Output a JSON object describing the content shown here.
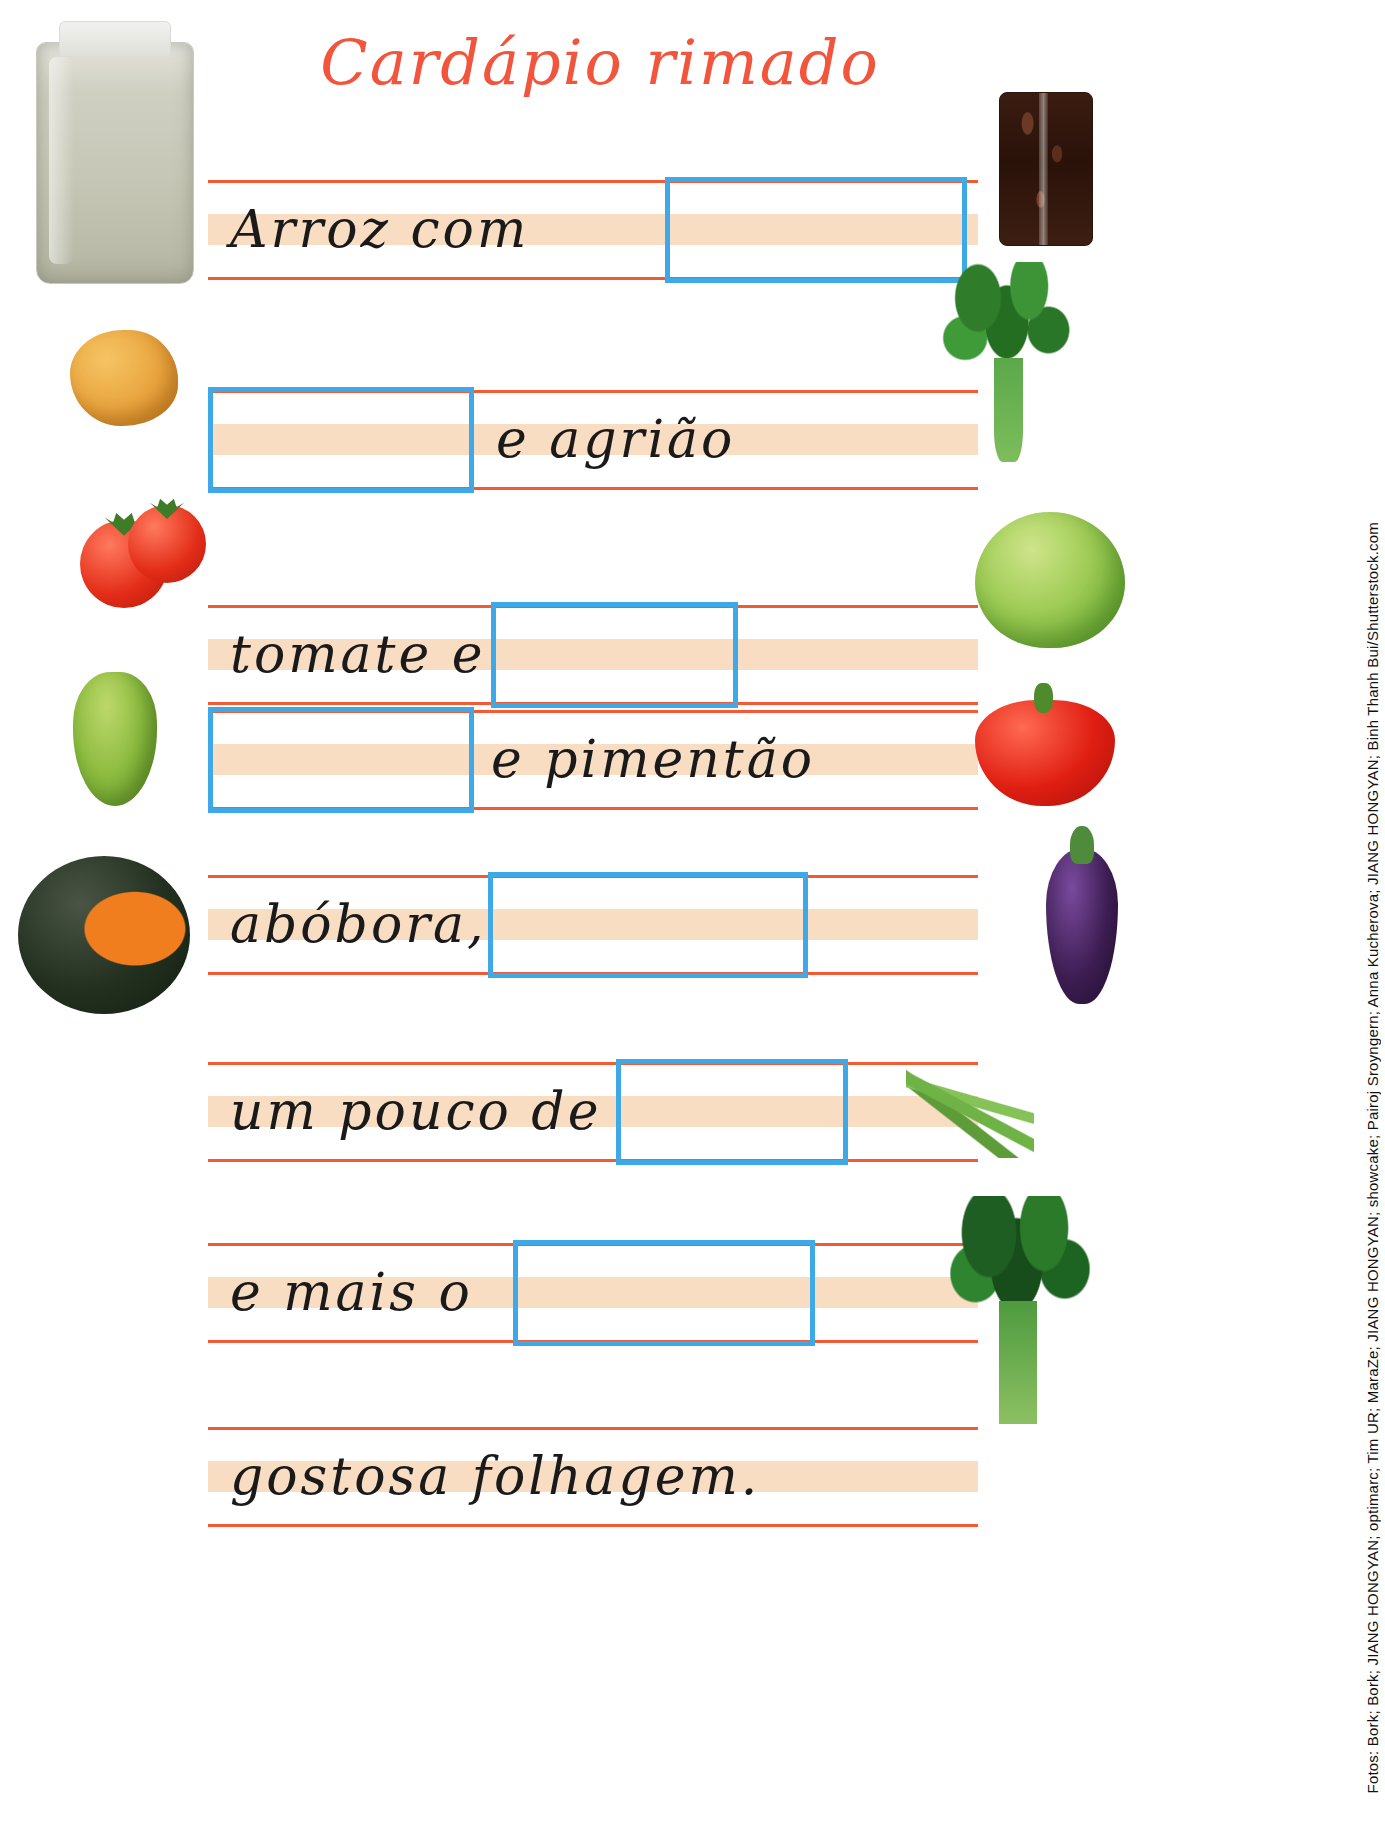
{
  "title": "Cardápio rimado",
  "colors": {
    "title": "#f2543c",
    "rule": "#f15a32",
    "band": "#f8ddc2",
    "answer_box": "#3fa9e8",
    "handwriting": "#1a1a1a"
  },
  "lines": [
    {
      "text": "Arroz com",
      "box_after": true,
      "box_first": false
    },
    {
      "text": "e agrião",
      "box_after": false,
      "box_first": true
    },
    {
      "text": "tomate e",
      "box_after": true,
      "box_first": false
    },
    {
      "text": "e pimentão",
      "box_after": false,
      "box_first": true
    },
    {
      "text": "abóbora,",
      "box_after": true,
      "box_first": false
    },
    {
      "text": "um pouco de",
      "box_after": true,
      "box_first": false
    },
    {
      "text": "e mais o",
      "box_after": true,
      "box_first": false
    },
    {
      "text": "gostosa folhagem.",
      "box_after": false,
      "box_first": false
    }
  ],
  "photos": [
    {
      "name": "rice-bag-photo",
      "label": "arroz"
    },
    {
      "name": "beans-bag-photo",
      "label": "feijão"
    },
    {
      "name": "potato-photo",
      "label": "batata"
    },
    {
      "name": "watercress-photo",
      "label": "agrião"
    },
    {
      "name": "tomato-photo",
      "label": "tomate"
    },
    {
      "name": "lettuce-photo",
      "label": "alface"
    },
    {
      "name": "chayote-photo",
      "label": "chuchu"
    },
    {
      "name": "bell-pepper-photo",
      "label": "pimentão"
    },
    {
      "name": "pumpkin-photo",
      "label": "abóbora"
    },
    {
      "name": "eggplant-photo",
      "label": "berinjela"
    },
    {
      "name": "green-beans-photo",
      "label": "vagem"
    },
    {
      "name": "spinach-photo",
      "label": "espinafre"
    }
  ],
  "credits": "Fotos: Bork; Bork; JIANG HONGYAN; optimarc; Tim UR; MaraZe; JIANG HONGYAN; showcake; Pairoj Sroyngern; Anna Kucherova; JIANG HONGYAN; Binh Thanh Bui/Shutterstock.com"
}
